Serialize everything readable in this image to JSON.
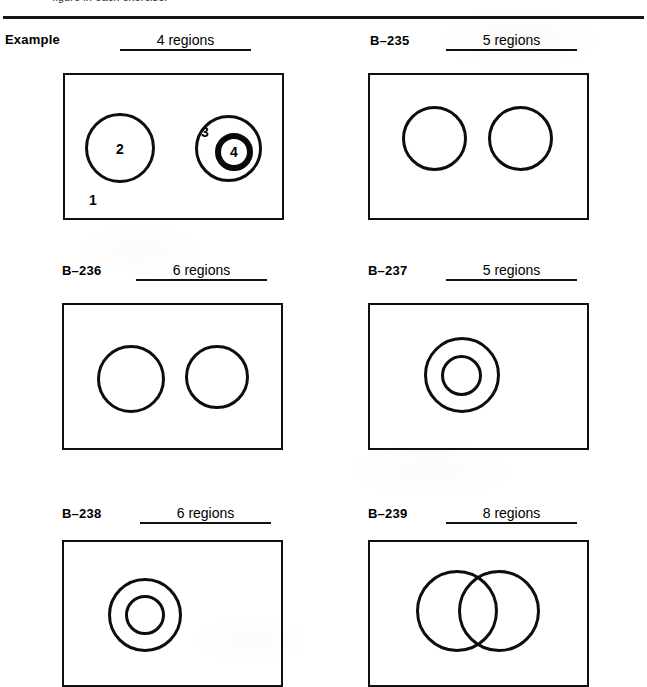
{
  "page": {
    "top_instruction": "figure in each exercise.",
    "background_color": "#ffffff",
    "ink_color": "#101010"
  },
  "exercises": [
    {
      "id": "example",
      "label": "Example",
      "answer": "4 regions",
      "region_count": 4,
      "figure": {
        "type": "rectangle-with-circles",
        "description": "Rectangle containing one separate circle and one pair of concentric circles",
        "region_labels": [
          "1",
          "2",
          "3",
          "4"
        ]
      }
    },
    {
      "id": "b-235",
      "label": "B–235",
      "answer": "5 regions",
      "region_count": 5,
      "figure": {
        "type": "rectangle-with-circles",
        "description": "Rectangle containing two separate non-overlapping circles",
        "region_labels": []
      }
    },
    {
      "id": "b-236",
      "label": "B–236",
      "answer": "6 regions",
      "region_count": 6,
      "figure": {
        "type": "rectangle-with-circles",
        "description": "Rectangle containing two separate non-overlapping circles",
        "region_labels": []
      }
    },
    {
      "id": "b-237",
      "label": "B–237",
      "answer": "5 regions",
      "region_count": 5,
      "figure": {
        "type": "rectangle-with-circles",
        "description": "Rectangle containing two concentric circles",
        "region_labels": []
      }
    },
    {
      "id": "b-238",
      "label": "B–238",
      "answer": "6 regions",
      "region_count": 6,
      "figure": {
        "type": "rectangle-with-circles",
        "description": "Rectangle containing two concentric circles",
        "region_labels": []
      }
    },
    {
      "id": "b-239",
      "label": "B–239",
      "answer": "8 regions",
      "region_count": 8,
      "figure": {
        "type": "rectangle-with-circles",
        "description": "Rectangle containing two overlapping circles",
        "region_labels": []
      }
    }
  ]
}
